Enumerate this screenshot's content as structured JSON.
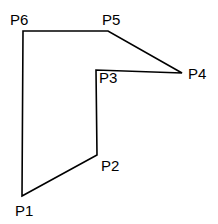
{
  "figure": {
    "name": "labeled-polygon",
    "background_color": "#ffffff",
    "stroke_color": "#000000",
    "label_color": "#000000",
    "stroke_width": 1.6,
    "width": 218,
    "height": 224
  },
  "chart_data": {
    "type": "diagram",
    "title": "",
    "xlabel": "",
    "ylabel": "",
    "shape": "closed-polygon",
    "vertex_count": 6,
    "vertex_order": [
      "P1",
      "P2",
      "P3",
      "P4",
      "P5",
      "P6"
    ],
    "points": [
      {
        "name": "P1",
        "x": 22,
        "y": 196
      },
      {
        "name": "P2",
        "x": 97,
        "y": 155
      },
      {
        "name": "P3",
        "x": 96,
        "y": 70
      },
      {
        "name": "P4",
        "x": 182,
        "y": 73
      },
      {
        "name": "P5",
        "x": 108,
        "y": 31
      },
      {
        "name": "P6",
        "x": 23,
        "y": 31
      }
    ],
    "edges": [
      {
        "from": "P1",
        "to": "P2"
      },
      {
        "from": "P2",
        "to": "P3"
      },
      {
        "from": "P3",
        "to": "P4"
      },
      {
        "from": "P4",
        "to": "P5"
      },
      {
        "from": "P5",
        "to": "P6"
      },
      {
        "from": "P6",
        "to": "P1"
      }
    ],
    "path_d": "M 22 196 L 97 155 L 96 70 L 182 73 L 108 31 L 23 31 Z"
  },
  "labels": {
    "p1": {
      "text": "P1",
      "x": 15,
      "y": 203
    },
    "p2": {
      "text": "P2",
      "x": 101,
      "y": 158
    },
    "p3": {
      "text": "P3",
      "x": 99,
      "y": 70
    },
    "p4": {
      "text": "P4",
      "x": 188,
      "y": 66
    },
    "p5": {
      "text": "P5",
      "x": 102,
      "y": 12
    },
    "p6": {
      "text": "P6",
      "x": 10,
      "y": 12
    }
  }
}
